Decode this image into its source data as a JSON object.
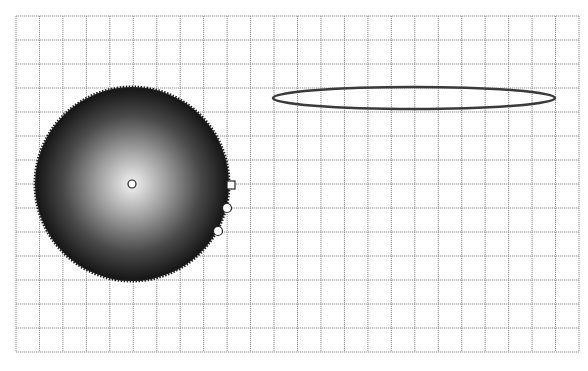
{
  "canvas": {
    "label": "Drawing canvas",
    "background": "#ffffff",
    "grid": {
      "x": 16,
      "y": 16,
      "width": 563,
      "height": 336,
      "cols": 24,
      "rows": 14,
      "line_color": "#8a8a8a",
      "dash": "1.2 0.8"
    }
  },
  "shapes": {
    "sphere": {
      "label": "Radial gradient circle (selected)",
      "cx": 132,
      "cy": 184,
      "r": 97,
      "gradient_center": "#f2f2f2",
      "gradient_edge": "#141414",
      "selection_outline_color": "#222222",
      "center_handle": {
        "cx": 132,
        "cy": 184,
        "r": 4
      },
      "handles": [
        {
          "type": "square",
          "x": 231,
          "y": 185,
          "size": 8
        },
        {
          "type": "circle",
          "cx": 227,
          "cy": 208,
          "r": 4.5
        },
        {
          "type": "circle",
          "cx": 218,
          "cy": 231,
          "r": 4.5
        }
      ]
    },
    "ellipse": {
      "label": "Outlined ellipse",
      "cx": 414,
      "cy": 98,
      "rx": 141,
      "ry": 11,
      "stroke": "#3a3a3a",
      "stroke_width": 2.5
    }
  }
}
